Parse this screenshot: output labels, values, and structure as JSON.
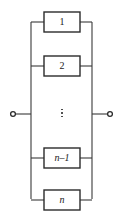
{
  "diagram": {
    "type": "electrical-schematic",
    "canvas": {
      "width": 123,
      "height": 221
    },
    "colors": {
      "stroke": "#3a3a3a",
      "box_stroke": "#2b2b2b",
      "background": "#ffffff",
      "text": "#1a1a1a",
      "terminal": "#2b2b2b"
    },
    "rails": {
      "left_x": 31,
      "right_x": 92,
      "top_y": 22,
      "bottom_y": 199
    },
    "terminals": [
      {
        "name": "left-terminal",
        "cx": 13,
        "cy": 114,
        "r": 2.6,
        "lead_from_x": 13,
        "lead_to_x": 31
      },
      {
        "name": "right-terminal",
        "cx": 110,
        "cy": 114,
        "r": 2.6,
        "lead_from_x": 92,
        "lead_to_x": 110
      }
    ],
    "branches": [
      {
        "id": "branch-1",
        "label": "1",
        "italic": false,
        "box": {
          "x": 44,
          "y": 12,
          "width": 36,
          "height": 20
        },
        "center_y": 22
      },
      {
        "id": "branch-2",
        "label": "2",
        "italic": false,
        "box": {
          "x": 44,
          "y": 56,
          "width": 36,
          "height": 20
        },
        "center_y": 66
      },
      {
        "id": "branch-ellipsis",
        "label": "⋮",
        "italic": false,
        "box": null,
        "center_y": 113,
        "is_ellipsis": true,
        "dots": 3
      },
      {
        "id": "branch-n-minus-1",
        "label": "n–1",
        "italic": true,
        "box": {
          "x": 44,
          "y": 148,
          "width": 36,
          "height": 20
        },
        "center_y": 158
      },
      {
        "id": "branch-n",
        "label": "n",
        "italic": true,
        "box": {
          "x": 44,
          "y": 190,
          "width": 36,
          "height": 20
        },
        "center_y": 200
      }
    ]
  }
}
